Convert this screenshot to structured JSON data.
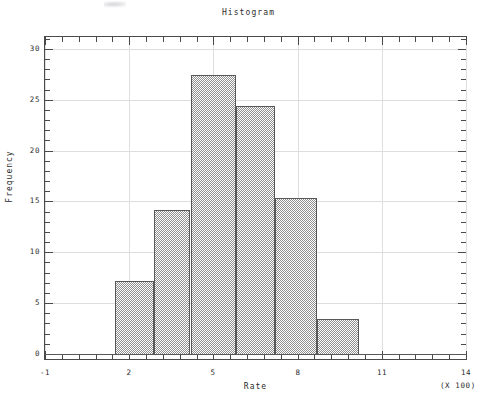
{
  "chart_data": {
    "type": "bar",
    "title": "Histogram",
    "xlabel": "Rate",
    "ylabel": "Frequency",
    "x_multiplier_note": "(X 100)",
    "xlim": [
      -1,
      14
    ],
    "ylim": [
      0,
      31
    ],
    "x_tick_labels": [
      "-1",
      "2",
      "5",
      "8",
      "11",
      "14"
    ],
    "x_tick_values": [
      -1,
      2,
      5,
      8,
      11,
      14
    ],
    "y_tick_labels": [
      "0",
      "5",
      "10",
      "15",
      "20",
      "25",
      "30"
    ],
    "y_tick_values": [
      0,
      5,
      10,
      15,
      20,
      25,
      30
    ],
    "grid": true,
    "legend": "none",
    "minor_ticks_per_interval": 5,
    "bin_edges": [
      1.5,
      2.9,
      4.2,
      5.8,
      7.2,
      8.7,
      10.2
    ],
    "categories": [
      "1.5-2.9",
      "2.9-4.2",
      "4.2-5.8",
      "5.8-7.2",
      "7.2-8.7",
      "8.7-10.2"
    ],
    "values": [
      7.2,
      14.2,
      27.4,
      24.4,
      15.3,
      3.4
    ],
    "bars": [
      {
        "x0": 1.5,
        "x1": 2.9,
        "height": 7.2
      },
      {
        "x0": 2.9,
        "x1": 4.2,
        "height": 14.2
      },
      {
        "x0": 4.2,
        "x1": 5.8,
        "height": 27.4
      },
      {
        "x0": 5.8,
        "x1": 7.2,
        "height": 24.4
      },
      {
        "x0": 7.2,
        "x1": 8.7,
        "height": 15.3
      },
      {
        "x0": 8.7,
        "x1": 10.2,
        "height": 3.4
      }
    ],
    "colors": {
      "bar_fill": "#8f8f8f",
      "bar_border": "#585858",
      "frame": "#4a4a4a",
      "grid": "#dedede",
      "text": "#2e2e2e",
      "background": "#ffffff"
    }
  }
}
